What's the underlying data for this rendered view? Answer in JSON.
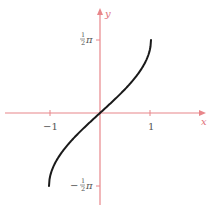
{
  "chart_data": {
    "type": "line",
    "title": "",
    "function": "y = arcsin(x)",
    "xlabel": "x",
    "ylabel": "y",
    "xlim": [
      -2,
      2
    ],
    "ylim": [
      -2.1,
      2.1
    ],
    "x_ticks": [
      {
        "value": -1,
        "label": "−1"
      },
      {
        "value": 1,
        "label": "1"
      }
    ],
    "y_ticks": [
      {
        "value": 1.5708,
        "label": "½π",
        "numerator": "1",
        "denominator": "2",
        "symbol": "π",
        "sign": ""
      },
      {
        "value": -1.5708,
        "label": "−½π",
        "numerator": "1",
        "denominator": "2",
        "symbol": "π",
        "sign": "−"
      }
    ],
    "grid": false,
    "legend": null,
    "series": [
      {
        "name": "arcsin",
        "x": [
          -1,
          -0.98,
          -0.9,
          -0.8,
          -0.6,
          -0.4,
          -0.2,
          0,
          0.2,
          0.4,
          0.6,
          0.8,
          0.9,
          0.98,
          1
        ],
        "y": [
          -1.5708,
          -1.3705,
          -1.1198,
          -0.9273,
          -0.6435,
          -0.4115,
          -0.2014,
          0,
          0.2014,
          0.4115,
          0.6435,
          0.9273,
          1.1198,
          1.3705,
          1.5708
        ]
      }
    ],
    "colors": {
      "axis": "#e8868a",
      "curve": "#1a1a1a",
      "labels": "#555555"
    }
  }
}
